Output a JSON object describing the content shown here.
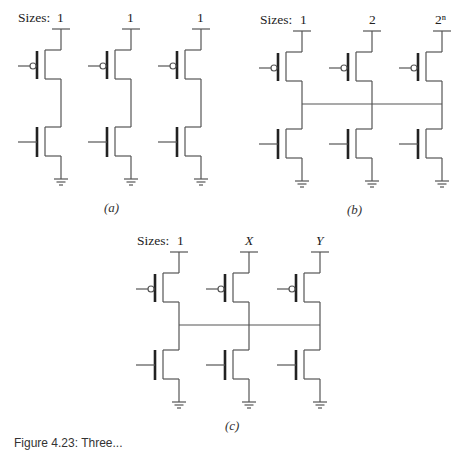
{
  "figure": {
    "panels": [
      {
        "id": "a",
        "sizes_label": "Sizes:",
        "sizes": [
          "1",
          "1",
          "1"
        ],
        "shared_output": false,
        "caption": "(a)"
      },
      {
        "id": "b",
        "sizes_label": "Sizes:",
        "sizes": [
          "1",
          "2",
          "2ⁿ"
        ],
        "shared_output": true,
        "caption": "(b)"
      },
      {
        "id": "c",
        "sizes_label": "Sizes:",
        "sizes": [
          "1",
          "X",
          "Y"
        ],
        "shared_output": true,
        "caption": "(c)"
      }
    ],
    "caption": "Figure 4.23: Three..."
  }
}
